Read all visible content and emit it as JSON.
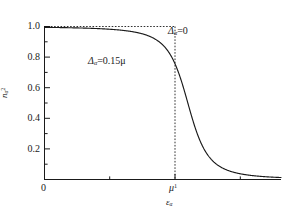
{
  "figure": {
    "background_color": "#ffffff",
    "line_color": "#1a1a1a",
    "text_color": "#1a1a1a"
  },
  "axes": {
    "x_label": "ε",
    "x_label_sub": "α",
    "y_label": "n",
    "y_label_sub": "α",
    "y_label_sup": "2",
    "x_ticks": [
      {
        "value": 0.0,
        "label": "0"
      },
      {
        "value": 1.0,
        "label": "μ",
        "sup": "1"
      }
    ],
    "y_ticks": [
      {
        "value": 0.0,
        "label": "0.0"
      },
      {
        "value": 0.2,
        "label": "0.2"
      },
      {
        "value": 0.4,
        "label": "0.4"
      },
      {
        "value": 0.6,
        "label": "0.6"
      },
      {
        "value": 0.8,
        "label": "0.8"
      },
      {
        "value": 1.0,
        "label": "1.0"
      }
    ],
    "y_tick_labels_visible": [
      "0.2",
      "0.4",
      "0.6",
      "0.8",
      "1.0"
    ],
    "xlim": [
      0,
      1.65
    ],
    "ylim": [
      0,
      1.05
    ],
    "grid": false
  },
  "annotations": [
    {
      "name": "delta-zero-annotation",
      "symbol": "Δ",
      "sub": "α",
      "eq": "=0",
      "text": "Δα=0",
      "x_px": 168,
      "y_px": 26
    },
    {
      "name": "delta-gap-annotation",
      "symbol": "Δ",
      "sub": "α",
      "eq": "=0.15μ",
      "text": "Δα=0.15μ",
      "x_px": 88,
      "y_px": 56
    }
  ],
  "chart_data": {
    "type": "line",
    "title": "",
    "xlabel": "εα",
    "ylabel": "nα²",
    "xlim": [
      0,
      1.65
    ],
    "ylim": [
      0,
      1.05
    ],
    "grid": false,
    "legend_position": "inline-annotations",
    "series": [
      {
        "name": "Δα=0",
        "style": "dashed",
        "description": "Step function: nα² = 1 for εα < μ, drops vertically to 0 at εα = μ",
        "x": [
          0.0,
          0.2,
          0.4,
          0.6,
          0.8,
          0.9,
          0.98,
          1.0,
          1.0,
          1.02,
          1.2,
          1.65
        ],
        "y": [
          1.0,
          1.0,
          1.0,
          1.0,
          1.0,
          1.0,
          1.0,
          1.0,
          0.0,
          0.0,
          0.0,
          0.0
        ]
      },
      {
        "name": "Δα=0.15μ",
        "style": "solid",
        "description": "Smoothed BCS-like occupation: nα² = 0.5*(1 - (εα-μ)/sqrt((εα-μ)²+Δα²)) with Δα=0.15μ",
        "x": [
          0.0,
          0.1,
          0.2,
          0.3,
          0.4,
          0.5,
          0.55,
          0.6,
          0.65,
          0.7,
          0.75,
          0.8,
          0.85,
          0.9,
          0.95,
          1.0,
          1.05,
          1.1,
          1.15,
          1.2,
          1.25,
          1.3,
          1.35,
          1.4,
          1.45,
          1.5,
          1.55,
          1.6,
          1.65
        ],
        "y": [
          0.9989,
          0.9985,
          0.998,
          0.9972,
          0.996,
          0.9941,
          0.9926,
          0.9904,
          0.987,
          0.9815,
          0.9722,
          0.9552,
          0.9231,
          0.858,
          0.7236,
          0.5,
          0.2764,
          0.142,
          0.0769,
          0.0448,
          0.0278,
          0.0185,
          0.013,
          0.0096,
          0.0074,
          0.0059,
          0.0048,
          0.004,
          0.0034
        ]
      }
    ],
    "markers": [
      {
        "name": "crossing-point",
        "x": 1.0,
        "y": 0.5,
        "note": "solid curve crosses εα=μ at nα²=0.5"
      }
    ],
    "reference_lines": [
      {
        "name": "horizontal-unity-line",
        "orientation": "horizontal",
        "value": 1.0,
        "style": "dotted",
        "x_from": 0.0,
        "x_to": 1.0
      },
      {
        "name": "vertical-mu-line",
        "orientation": "vertical",
        "value": 1.0,
        "style": "dotted",
        "y_from": 0.0,
        "y_to": 1.0
      }
    ]
  }
}
